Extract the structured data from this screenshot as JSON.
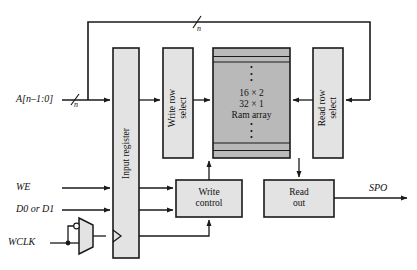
{
  "diagram": {
    "colors": {
      "line": "#1a1a1a",
      "box_fill": "#e3e3e3",
      "box_stroke": "#1a1a1a",
      "ram_fill": "#b9b9b9",
      "text": "#111111",
      "background": "#ffffff"
    },
    "blocks": [
      {
        "id": "input-register",
        "label": "Input register",
        "orientation": "vertical",
        "fill": "light"
      },
      {
        "id": "write-row-select",
        "label": "Write row\nselect",
        "orientation": "vertical",
        "fill": "light"
      },
      {
        "id": "ram-array",
        "label": "16 × 2\n32 × 1\nRam array",
        "orientation": "horizontal",
        "fill": "dark"
      },
      {
        "id": "read-row-select",
        "label": "Read row\nselect",
        "orientation": "vertical",
        "fill": "light"
      },
      {
        "id": "write-control",
        "label": "Write\ncontrol",
        "orientation": "horizontal",
        "fill": "light"
      },
      {
        "id": "read-out",
        "label": "Read\nout",
        "orientation": "horizontal",
        "fill": "light"
      }
    ],
    "ram_array": {
      "line1": "16 × 2",
      "line2": "32 × 1",
      "line3": "Ram array",
      "dots_top": "•\n•\n•",
      "dots_bottom": "•\n•\n•"
    },
    "signals": {
      "address_in": "A[n–1:0]",
      "address_width": "n",
      "feedback_width": "n",
      "write_enable": "WE",
      "data_in": "D0 or D1",
      "write_clock": "WCLK",
      "output": "SPO"
    },
    "mux": {
      "name": "clock-polarity-mux",
      "bubble": "inversion-bubble"
    }
  }
}
